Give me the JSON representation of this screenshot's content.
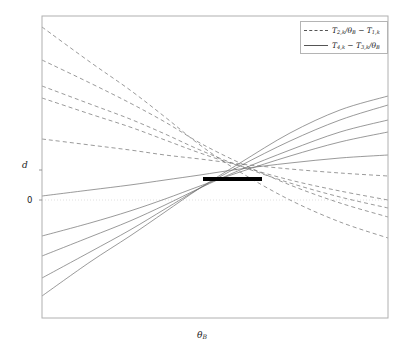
{
  "chart_data": {
    "type": "line",
    "title": "",
    "xlabel": "θ_B",
    "ylabel": "d",
    "xlabel_display": "θ",
    "xlabel_sub": "B",
    "ylabel_display": "d",
    "grid": false,
    "zero_gridline": true,
    "yticks": [
      "d",
      "0"
    ],
    "ytick_values": [
      170,
      200
    ],
    "legend": {
      "position": "top-right",
      "entries": [
        {
          "style": "dashed",
          "label": "T_{2,k}/θ_B - T_{1,k}",
          "parts": [
            {
              "t": "T",
              "sub": "2,k"
            },
            {
              "t": "/θ",
              "sub": "B"
            },
            {
              "t": " − T",
              "sub": "1,k"
            }
          ]
        },
        {
          "style": "solid",
          "label": "T_{4,k} - T_{3,k}/θ_B",
          "parts": [
            {
              "t": "T",
              "sub": "4,k"
            },
            {
              "t": " − T",
              "sub": "3,k"
            },
            {
              "t": "/θ",
              "sub": "B"
            }
          ]
        }
      ]
    },
    "axes": {
      "frame": {
        "left": 42,
        "top": 16,
        "right": 388,
        "bottom": 318
      },
      "zero_line_y": 200,
      "d_line_y": 170
    },
    "series": [
      {
        "name": "dashed-1",
        "style": "dashed",
        "color": "#6e6e6e",
        "points": [
          [
            42,
            27
          ],
          [
            90,
            62
          ],
          [
            130,
            90
          ],
          [
            165,
            117
          ],
          [
            200,
            145
          ],
          [
            240,
            172
          ],
          [
            290,
            200
          ],
          [
            340,
            222
          ],
          [
            388,
            238
          ]
        ]
      },
      {
        "name": "dashed-2",
        "style": "dashed",
        "color": "#6e6e6e",
        "points": [
          [
            42,
            60
          ],
          [
            90,
            83
          ],
          [
            130,
            103
          ],
          [
            165,
            122
          ],
          [
            200,
            143
          ],
          [
            240,
            163
          ],
          [
            290,
            185
          ],
          [
            340,
            203
          ],
          [
            388,
            217
          ]
        ]
      },
      {
        "name": "dashed-3",
        "style": "dashed",
        "color": "#6e6e6e",
        "points": [
          [
            42,
            86
          ],
          [
            90,
            104
          ],
          [
            130,
            119
          ],
          [
            165,
            134
          ],
          [
            200,
            150
          ],
          [
            240,
            166
          ],
          [
            290,
            183
          ],
          [
            340,
            197
          ],
          [
            388,
            208
          ]
        ]
      },
      {
        "name": "dashed-4",
        "style": "dashed",
        "color": "#6e6e6e",
        "points": [
          [
            42,
            98
          ],
          [
            90,
            114
          ],
          [
            130,
            127
          ],
          [
            165,
            140
          ],
          [
            200,
            153
          ],
          [
            240,
            166
          ],
          [
            290,
            180
          ],
          [
            340,
            191
          ],
          [
            388,
            200
          ]
        ]
      },
      {
        "name": "dashed-5",
        "style": "dashed",
        "color": "#6e6e6e",
        "points": [
          [
            42,
            139
          ],
          [
            90,
            145
          ],
          [
            130,
            150
          ],
          [
            165,
            155
          ],
          [
            200,
            159
          ],
          [
            240,
            164
          ],
          [
            290,
            169
          ],
          [
            340,
            173
          ],
          [
            388,
            176
          ]
        ]
      },
      {
        "name": "solid-1",
        "style": "solid",
        "color": "#6e6e6e",
        "points": [
          [
            42,
            296
          ],
          [
            90,
            262
          ],
          [
            130,
            236
          ],
          [
            165,
            212
          ],
          [
            200,
            188
          ],
          [
            240,
            163
          ],
          [
            290,
            133
          ],
          [
            340,
            110
          ],
          [
            388,
            96
          ]
        ]
      },
      {
        "name": "solid-2",
        "style": "solid",
        "color": "#6e6e6e",
        "points": [
          [
            42,
            278
          ],
          [
            90,
            252
          ],
          [
            130,
            230
          ],
          [
            165,
            209
          ],
          [
            200,
            188
          ],
          [
            240,
            166
          ],
          [
            290,
            141
          ],
          [
            340,
            120
          ],
          [
            388,
            105
          ]
        ]
      },
      {
        "name": "solid-3",
        "style": "solid",
        "color": "#6e6e6e",
        "points": [
          [
            42,
            256
          ],
          [
            90,
            237
          ],
          [
            130,
            221
          ],
          [
            165,
            205
          ],
          [
            200,
            188
          ],
          [
            240,
            170
          ],
          [
            290,
            150
          ],
          [
            340,
            132
          ],
          [
            388,
            120
          ]
        ]
      },
      {
        "name": "solid-4",
        "style": "solid",
        "color": "#6e6e6e",
        "points": [
          [
            42,
            236
          ],
          [
            90,
            223
          ],
          [
            130,
            211
          ],
          [
            165,
            199
          ],
          [
            200,
            186
          ],
          [
            240,
            172
          ],
          [
            290,
            156
          ],
          [
            340,
            142
          ],
          [
            388,
            132
          ]
        ]
      },
      {
        "name": "solid-5",
        "style": "solid",
        "color": "#6e6e6e",
        "points": [
          [
            42,
            196
          ],
          [
            90,
            190
          ],
          [
            130,
            185
          ],
          [
            165,
            180
          ],
          [
            200,
            175
          ],
          [
            240,
            169
          ],
          [
            290,
            163
          ],
          [
            340,
            158
          ],
          [
            388,
            155
          ]
        ]
      }
    ],
    "annotation_bar": {
      "name": "highlight-bar",
      "x1": 203,
      "x2": 262,
      "y": 179,
      "thickness": 4,
      "color": "#000000"
    }
  }
}
